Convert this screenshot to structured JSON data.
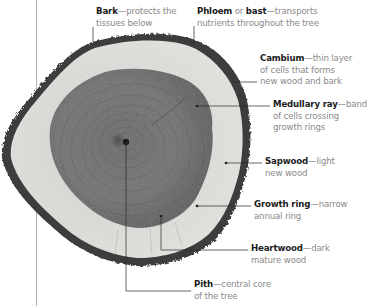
{
  "diagram": {
    "colors": {
      "bark": "#3c3c3c",
      "sapwood": "#d9d9d6",
      "heartwood": "#6b6b6b",
      "leader": "#2a2a2a",
      "term_text": "#1a1a1a",
      "description_text": "#8a8a8a",
      "margin_rule": "#9a9a9a"
    },
    "labels": [
      {
        "id": "bark",
        "term": "Bark",
        "connector": "—",
        "line1": "protects the",
        "line2": "tissues below"
      },
      {
        "id": "phloem",
        "term": "Phloem",
        "middle": " or ",
        "term2": "bast",
        "connector": "—",
        "line1": "transports",
        "line2": "nutrients throughout the tree"
      },
      {
        "id": "cambium",
        "term": "Cambium",
        "connector": "—",
        "line1": "thin layer",
        "line2": "of cells that forms",
        "line3": "new wood and bark"
      },
      {
        "id": "medullary-ray",
        "term": "Medullary ray",
        "connector": "—",
        "line1": "band",
        "line2": "of cells crossing",
        "line3": "growth rings"
      },
      {
        "id": "sapwood",
        "term": "Sapwood",
        "connector": "—",
        "line1": "light",
        "line2": "new wood"
      },
      {
        "id": "growth-ring",
        "term": "Growth ring",
        "connector": "—",
        "line1": "narrow",
        "line2": "annual ring"
      },
      {
        "id": "heartwood",
        "term": "Heartwood",
        "connector": "—",
        "line1": "dark",
        "line2": "mature wood"
      },
      {
        "id": "pith",
        "term": "Pith",
        "connector": "—",
        "line1": "central core",
        "line2": "of the tree"
      }
    ]
  }
}
